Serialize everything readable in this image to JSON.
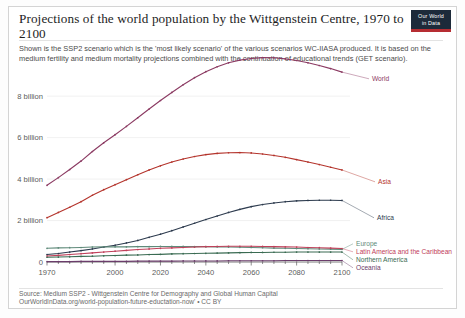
{
  "header": {
    "title": "Projections of the world population by the Wittgenstein Centre, 1970 to 2100",
    "subtitle": "Shown is the SSP2 scenario which is the 'most likely scenario' of the various scenarios WC-IIASA produced. It is based on the medium fertility and medium mortality projections combined with the continuation of educational trends (GET scenario).",
    "logo_line1": "Our World",
    "logo_line2": "in Data",
    "logo_bg": "#1d2a3a",
    "logo_accent": "#b62d32"
  },
  "footer": {
    "source_line1": "Source: Medium SSP2 - Wittgenstein Centre for Demography and Global Human Capital",
    "source_line2": "OurWorldInData.org/world-population-future-eductation-now' • CC BY"
  },
  "chart_data": {
    "type": "line",
    "title": "Projections of the world population by the Wittgenstein Centre, 1970 to 2100",
    "xlabel": "",
    "ylabel": "",
    "xlim": [
      1970,
      2100
    ],
    "ylim": [
      0,
      9.6
    ],
    "grid": true,
    "legend_position": "right-inline",
    "y_ticks": [
      0,
      2,
      4,
      6,
      8
    ],
    "y_tick_labels": [
      "0",
      "2 billion",
      "4 billion",
      "6 billion",
      "8 billion"
    ],
    "x_ticks": [
      1970,
      2000,
      2020,
      2040,
      2060,
      2080,
      2100
    ],
    "x_tick_labels": [
      "1970",
      "2000",
      "2020",
      "2040",
      "2060",
      "2080",
      "2100"
    ],
    "x": [
      1970,
      1975,
      1980,
      1985,
      1990,
      1995,
      2000,
      2005,
      2010,
      2015,
      2020,
      2025,
      2030,
      2035,
      2040,
      2045,
      2050,
      2055,
      2060,
      2065,
      2070,
      2075,
      2080,
      2085,
      2090,
      2095,
      2100
    ],
    "series": [
      {
        "name": "World",
        "color": "#8b3a62",
        "values": [
          3.7,
          4.07,
          4.46,
          4.87,
          5.33,
          5.75,
          6.14,
          6.54,
          6.96,
          7.38,
          7.79,
          8.18,
          8.55,
          8.89,
          9.18,
          9.42,
          9.61,
          9.74,
          9.82,
          9.86,
          9.85,
          9.8,
          9.72,
          9.61,
          9.48,
          9.33,
          9.16
        ]
      },
      {
        "name": "Asia",
        "color": "#b4342c",
        "values": [
          2.14,
          2.39,
          2.64,
          2.91,
          3.22,
          3.49,
          3.73,
          3.97,
          4.21,
          4.44,
          4.64,
          4.82,
          4.97,
          5.09,
          5.18,
          5.24,
          5.27,
          5.28,
          5.26,
          5.21,
          5.14,
          5.05,
          4.94,
          4.82,
          4.7,
          4.57,
          4.44
        ]
      },
      {
        "name": "Africa",
        "color": "#2d3b4e",
        "values": [
          0.36,
          0.41,
          0.48,
          0.55,
          0.63,
          0.72,
          0.81,
          0.92,
          1.04,
          1.19,
          1.34,
          1.51,
          1.69,
          1.87,
          2.05,
          2.22,
          2.39,
          2.54,
          2.67,
          2.77,
          2.85,
          2.91,
          2.95,
          2.97,
          2.98,
          2.98,
          2.97
        ]
      },
      {
        "name": "Europe",
        "color": "#5f8a7a",
        "values": [
          0.66,
          0.68,
          0.69,
          0.7,
          0.72,
          0.73,
          0.73,
          0.73,
          0.74,
          0.74,
          0.75,
          0.75,
          0.75,
          0.74,
          0.74,
          0.73,
          0.72,
          0.71,
          0.7,
          0.69,
          0.67,
          0.66,
          0.65,
          0.64,
          0.63,
          0.62,
          0.61
        ]
      },
      {
        "name": "Latin America and the Caribbean",
        "color": "#c0405a",
        "values": [
          0.29,
          0.32,
          0.36,
          0.4,
          0.44,
          0.48,
          0.52,
          0.56,
          0.6,
          0.63,
          0.66,
          0.68,
          0.7,
          0.72,
          0.74,
          0.75,
          0.76,
          0.76,
          0.76,
          0.75,
          0.74,
          0.73,
          0.72,
          0.7,
          0.69,
          0.67,
          0.65
        ]
      },
      {
        "name": "Northern America",
        "color": "#3a6b52",
        "values": [
          0.23,
          0.24,
          0.25,
          0.27,
          0.28,
          0.3,
          0.31,
          0.33,
          0.34,
          0.36,
          0.37,
          0.39,
          0.4,
          0.41,
          0.42,
          0.43,
          0.44,
          0.45,
          0.46,
          0.46,
          0.47,
          0.47,
          0.48,
          0.48,
          0.48,
          0.48,
          0.48
        ]
      },
      {
        "name": "Oceania",
        "color": "#6b3d6b",
        "values": [
          0.02,
          0.02,
          0.02,
          0.03,
          0.03,
          0.03,
          0.03,
          0.03,
          0.04,
          0.04,
          0.04,
          0.04,
          0.05,
          0.05,
          0.05,
          0.05,
          0.06,
          0.06,
          0.06,
          0.06,
          0.06,
          0.07,
          0.07,
          0.07,
          0.07,
          0.07,
          0.07
        ]
      }
    ],
    "inline_labels": [
      {
        "name": "World",
        "x": 363,
        "y": 74,
        "color": "#8b3a62"
      },
      {
        "name": "Asia",
        "x": 369,
        "y": 177,
        "color": "#b4342c"
      },
      {
        "name": "Africa",
        "x": 368,
        "y": 213,
        "color": "#2d3b4e"
      },
      {
        "name": "Europe",
        "x": 347,
        "y": 239,
        "color": "#5f8a7a"
      },
      {
        "name": "Latin America and the Caribbean",
        "x": 347,
        "y": 247,
        "color": "#c0405a"
      },
      {
        "name": "Northern America",
        "x": 347,
        "y": 255,
        "color": "#3a6b52"
      },
      {
        "name": "Oceania",
        "x": 347,
        "y": 263,
        "color": "#6b3d6b"
      }
    ]
  }
}
